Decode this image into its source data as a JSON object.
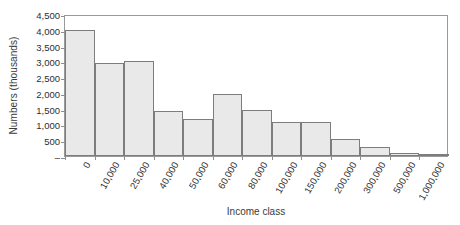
{
  "chart_data": {
    "type": "bar",
    "title": "",
    "xlabel": "Income class",
    "ylabel": "Numbers (thousands)",
    "categories": [
      "0",
      "10,000",
      "25,000",
      "40,000",
      "50,000",
      "60,000",
      "80,000",
      "100,000",
      "150,000",
      "200,000",
      "300,000",
      "500,000",
      "1,000,000"
    ],
    "values": [
      4000,
      2950,
      3000,
      1430,
      1180,
      1950,
      1470,
      1080,
      1080,
      540,
      300,
      110,
      25
    ],
    "ylim": [
      0,
      4500
    ],
    "ytick_values": [
      0,
      500,
      1000,
      1500,
      2000,
      2500,
      3000,
      3500,
      4000,
      4500
    ],
    "ytick_labels": [
      "–",
      "500",
      "1,000",
      "1,500",
      "2,000",
      "2,500",
      "3,000",
      "3,500",
      "4,000",
      "4,500"
    ],
    "grid": false,
    "legend": null,
    "bar_fill_color": "#e9e9e9",
    "bar_border_color": "#7d7d7d",
    "axis_color": "#9a9a9a",
    "background_color": "#ffffff"
  }
}
